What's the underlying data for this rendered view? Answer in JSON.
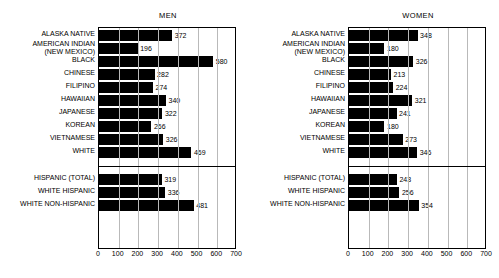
{
  "chart_data": [
    {
      "type": "bar",
      "title": "MEN",
      "orientation": "horizontal",
      "xlabel": "",
      "ylabel": "",
      "xlim": [
        0,
        700
      ],
      "xticks": [
        0,
        100,
        200,
        300,
        400,
        500,
        600,
        700
      ],
      "grid": true,
      "legend": "none",
      "groups": [
        {
          "name": "race",
          "categories": [
            "ALASKA NATIVE",
            "AMERICAN INDIAN (NEW MEXICO)",
            "BLACK",
            "CHINESE",
            "FILIPINO",
            "HAWAIIAN",
            "JAPANESE",
            "KOREAN",
            "VIETNAMESE",
            "WHITE"
          ],
          "values": [
            372,
            196,
            580,
            282,
            274,
            340,
            322,
            266,
            326,
            469
          ]
        },
        {
          "name": "hispanic-origin",
          "categories": [
            "HISPANIC (TOTAL)",
            "WHITE HISPANIC",
            "WHITE NON-HISPANIC"
          ],
          "values": [
            319,
            336,
            481
          ]
        }
      ]
    },
    {
      "type": "bar",
      "title": "WOMEN",
      "orientation": "horizontal",
      "xlabel": "",
      "ylabel": "",
      "xlim": [
        0,
        700
      ],
      "xticks": [
        0,
        100,
        200,
        300,
        400,
        500,
        600,
        700
      ],
      "grid": true,
      "legend": "none",
      "groups": [
        {
          "name": "race",
          "categories": [
            "ALASKA NATIVE",
            "AMERICAN INDIAN (NEW MEXICO)",
            "BLACK",
            "CHINESE",
            "FILIPINO",
            "HAWAIIAN",
            "JAPANESE",
            "KOREAN",
            "VIETNAMESE",
            "WHITE"
          ],
          "values": [
            348,
            180,
            326,
            213,
            224,
            321,
            241,
            180,
            273,
            346
          ]
        },
        {
          "name": "hispanic-origin",
          "categories": [
            "HISPANIC (TOTAL)",
            "WHITE HISPANIC",
            "WHITE NON-HISPANIC"
          ],
          "values": [
            243,
            256,
            354
          ]
        }
      ]
    }
  ],
  "style": {
    "bar_color": "#000000",
    "grid_color": "#b9b9b9",
    "frame_color": "#000000",
    "background": "#ffffff"
  },
  "labels": {
    "alaska_native": "ALASKA NATIVE",
    "american_indian_l1": "AMERICAN INDIAN",
    "american_indian_l2": "(NEW MEXICO)",
    "black": "BLACK",
    "chinese": "CHINESE",
    "filipino": "FILIPINO",
    "hawaiian": "HAWAIIAN",
    "japanese": "JAPANESE",
    "korean": "KOREAN",
    "vietnamese": "VIETNAMESE",
    "white": "WHITE",
    "hispanic_total": "HISPANIC (TOTAL)",
    "white_hispanic": "WHITE HISPANIC",
    "white_non_hispanic": "WHITE NON-HISPANIC"
  }
}
